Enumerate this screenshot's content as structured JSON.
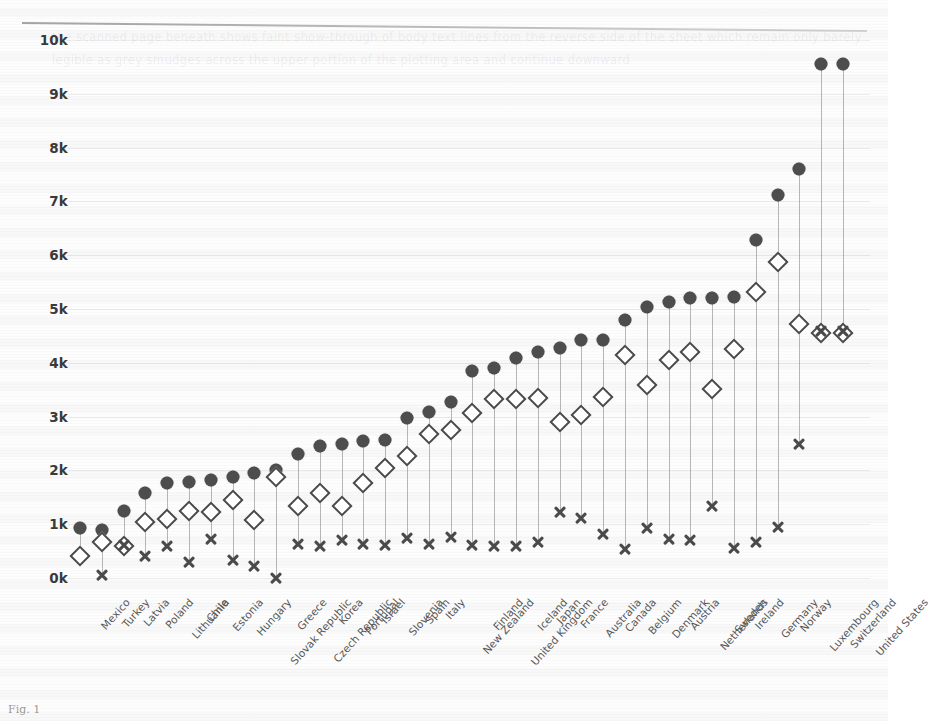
{
  "figure": {
    "caption": "Fig. 1",
    "ghost_text": "the scanned page beneath shows faint show-through of body text lines from the reverse side of the sheet which remain only barely legible as grey smudges across the upper portion of the plotting area and continue downward"
  },
  "chart_data": {
    "type": "scatter",
    "title": "",
    "subtitle": "",
    "xlabel": "",
    "ylabel": "",
    "ylim": [
      0,
      10000
    ],
    "yticks": [
      0,
      1000,
      2000,
      3000,
      4000,
      5000,
      6000,
      7000,
      8000,
      9000,
      10000
    ],
    "ytick_labels": [
      "0k",
      "1k",
      "2k",
      "3k",
      "4k",
      "5k",
      "6k",
      "7k",
      "8k",
      "9k",
      "10k"
    ],
    "grid": true,
    "legend_position": "none",
    "categories": [
      "Mexico",
      "Turkey",
      "Latvia",
      "Poland",
      "Lithuania",
      "Chile",
      "Estonia",
      "Hungary",
      "Slovak Republic",
      "Greece",
      "Czech Republic",
      "Korea",
      "Portugal",
      "Israel",
      "Slovenia",
      "Spain",
      "Italy",
      "New Zealand",
      "Finland",
      "United Kingdom",
      "Iceland",
      "Japan",
      "France",
      "Australia",
      "Canada",
      "Belgium",
      "Denmark",
      "Austria",
      "Netherlands",
      "Sweden",
      "Ireland",
      "Germany",
      "Norway",
      "Luxembourg",
      "Switzerland",
      "United States"
    ],
    "series": [
      {
        "name": "Total expenditure per capita",
        "marker": "filled-circle",
        "color": "#4d4d4d",
        "values": [
          930,
          900,
          1240,
          1580,
          1760,
          1780,
          1830,
          1880,
          1950,
          2000,
          2300,
          2450,
          2500,
          2550,
          2570,
          2980,
          3080,
          3270,
          3840,
          3900,
          4080,
          4200,
          4280,
          4420,
          4430,
          4800,
          5030,
          5130,
          5200,
          5210,
          5230,
          6280,
          7120,
          7600,
          9550,
          9550
        ]
      },
      {
        "name": "Government / compulsory schemes",
        "marker": "open-diamond",
        "color": "#4a4a4a",
        "values": [
          400,
          660,
          600,
          1050,
          1100,
          1250,
          1230,
          1450,
          1080,
          1880,
          1330,
          1580,
          1330,
          1760,
          2050,
          2270,
          2670,
          2760,
          3070,
          3320,
          3330,
          3350,
          2900,
          3030,
          3370,
          4140,
          3580,
          4050,
          4200,
          3520,
          4250,
          5320,
          5870,
          4730,
          4550,
          4550
        ]
      },
      {
        "name": "Out-of-pocket / voluntary",
        "marker": "cross",
        "color": "#4a4a4a",
        "values": [
          null,
          50,
          620,
          400,
          600,
          300,
          720,
          330,
          230,
          0,
          640,
          600,
          700,
          640,
          620,
          740,
          640,
          770,
          620,
          600,
          590,
          660,
          1220,
          1110,
          820,
          540,
          930,
          730,
          700,
          1330,
          550,
          660,
          950,
          2500,
          4600,
          4600
        ]
      }
    ]
  },
  "axis": {
    "y_top_value": 10000,
    "y_bottom_value": 0
  }
}
